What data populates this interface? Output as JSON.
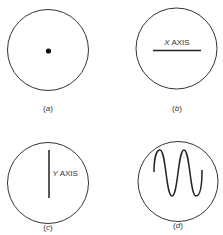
{
  "figure": {
    "panels": [
      {
        "id": "a",
        "label": "(a)",
        "description": "dot"
      },
      {
        "id": "b",
        "label": "(b)",
        "description": "horizontal line",
        "text": "X AXIS"
      },
      {
        "id": "c",
        "label": "(c)",
        "description": "vertical line",
        "text": "Y AXIS"
      },
      {
        "id": "d",
        "label": "(d)",
        "description": "sine wave"
      }
    ],
    "colors": {
      "stroke": "#333333",
      "background": "#ffffff"
    }
  }
}
